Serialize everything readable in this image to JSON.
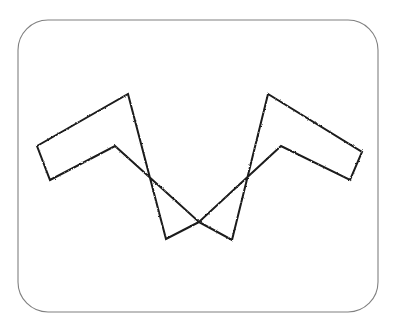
{
  "figure": {
    "canvas": {
      "width": 397,
      "height": 332,
      "background": "#ffffff"
    },
    "frame": {
      "name": "rounded-rectangle-border",
      "x": 18,
      "y": 20,
      "width": 360,
      "height": 292,
      "corner_radius": 30,
      "stroke_color": "#808080",
      "stroke_width": 1.1,
      "fill_color": "#ffffff"
    },
    "shape": {
      "name": "w-zigzag-polygon",
      "stroke_color": "#1a1a1a",
      "stroke_width": 2,
      "fill_color": "#ffffff",
      "vertex_count": 10,
      "closed": true,
      "points": "37,146 128,94 166,239 199,222 232,240 268,94 362,152 350,180 281,146 199,222 115,146 50,180",
      "vertices": [
        {
          "label": "left-tip-top",
          "x": 37,
          "y": 146
        },
        {
          "label": "peak-left",
          "x": 128,
          "y": 94
        },
        {
          "label": "valley-left-outer",
          "x": 166,
          "y": 239
        },
        {
          "label": "center-notch",
          "x": 199,
          "y": 222
        },
        {
          "label": "valley-right-outer",
          "x": 232,
          "y": 240
        },
        {
          "label": "peak-right",
          "x": 268,
          "y": 94
        },
        {
          "label": "right-tip-top",
          "x": 362,
          "y": 152
        },
        {
          "label": "right-tip-bottom",
          "x": 350,
          "y": 180
        },
        {
          "label": "inner-corner-right",
          "x": 281,
          "y": 146
        },
        {
          "label": "inner-corner-left",
          "x": 115,
          "y": 146
        },
        {
          "label": "left-tip-bottom",
          "x": 50,
          "y": 180
        }
      ]
    }
  }
}
